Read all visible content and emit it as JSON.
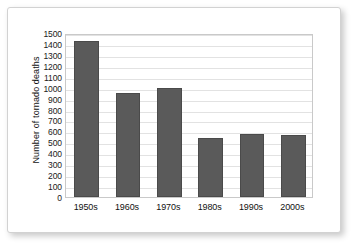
{
  "chart_data": {
    "type": "bar",
    "title": "",
    "xlabel": "",
    "ylabel": "Number of tornado deaths",
    "categories": [
      "1950s",
      "1960s",
      "1970s",
      "1980s",
      "1990s",
      "2000s"
    ],
    "values": [
      1430,
      950,
      1000,
      540,
      580,
      565
    ],
    "ylim": [
      0,
      1500
    ],
    "ytick_step": 100,
    "yticks": [
      "1500",
      "1400",
      "1300",
      "1200",
      "1100",
      "1000",
      "900",
      "800",
      "700",
      "600",
      "500",
      "400",
      "300",
      "200",
      "100",
      "0"
    ],
    "grid": true,
    "grid_axis": "y",
    "legend": false,
    "legend_position": "none",
    "series": [
      {
        "name": "Number of tornado deaths",
        "values": [
          1430,
          950,
          1000,
          540,
          580,
          565
        ]
      }
    ],
    "colors": {
      "bar_fill": "#5a5a5a",
      "bar_edge": "#4a4a4a",
      "gridline": "#e2e2e2",
      "plot_border": "#c9c9c9",
      "background": "#ffffff",
      "text": "#111111",
      "card_border": "#d2d2d2"
    }
  }
}
